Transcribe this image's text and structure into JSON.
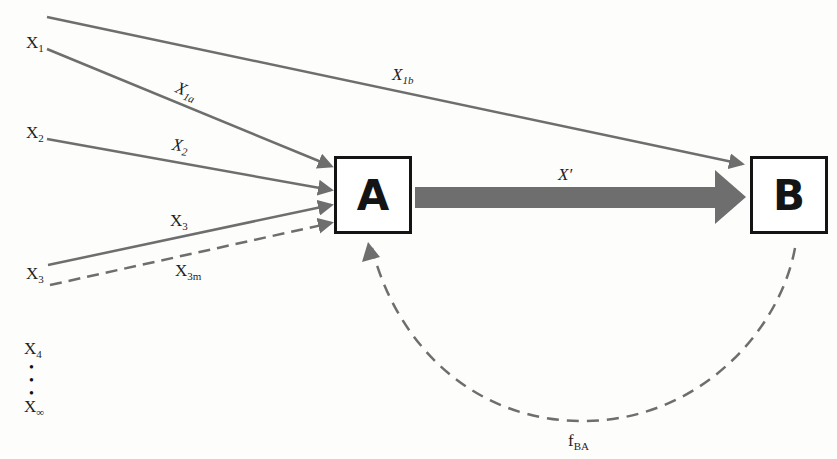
{
  "nodes": {
    "A": {
      "label": "A"
    },
    "B": {
      "label": "B"
    }
  },
  "inputs": [
    {
      "base": "X",
      "sub": "1"
    },
    {
      "base": "X",
      "sub": "2"
    },
    {
      "base": "X",
      "sub": "3"
    },
    {
      "base": "X",
      "sub": "4"
    },
    {
      "base": "X",
      "sub": "∞"
    }
  ],
  "edges": {
    "x1b": {
      "base": "X",
      "sub": "1b"
    },
    "x1a": {
      "base": "X",
      "sub": "1a"
    },
    "x2": {
      "base": "X",
      "sub": "2"
    },
    "x3": {
      "base": "X",
      "sub": "3"
    },
    "x3m": {
      "base": "X",
      "sub": "3m"
    },
    "xprime": {
      "label": "X′"
    },
    "fba": {
      "base": "f",
      "sub": "BA"
    }
  },
  "ellipsis": "•\n•\n•",
  "colors": {
    "arrow": "#6e6e6e",
    "box_border": "#141414",
    "text": "#1e1e1e"
  }
}
